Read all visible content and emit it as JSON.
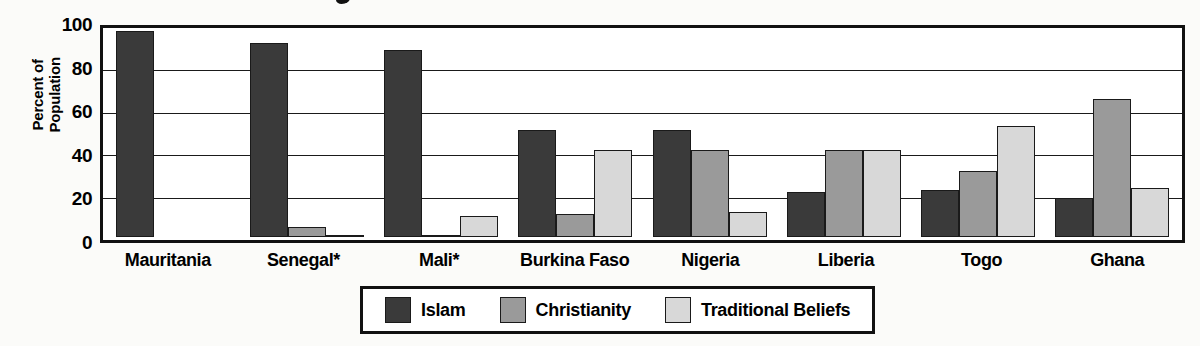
{
  "chart_data": {
    "type": "bar",
    "title": "",
    "xlabel": "",
    "ylabel": "Percent of Population",
    "ylabel_lines": [
      "Percent of",
      "Population"
    ],
    "ylim": [
      0,
      100
    ],
    "yticks": [
      100,
      80,
      60,
      40,
      20,
      0
    ],
    "grid": true,
    "legend_position": "bottom-center",
    "categories": [
      "Mauritania",
      "Senegal*",
      "Mali*",
      "Burkina Faso",
      "Nigeria",
      "Liberia",
      "Togo",
      "Ghana"
    ],
    "series": [
      {
        "name": "Islam",
        "color": "#3a3a3a",
        "values": [
          100,
          94,
          91,
          52,
          52,
          22,
          23,
          19
        ]
      },
      {
        "name": "Christianity",
        "color": "#9a9a9a",
        "values": [
          0,
          5,
          1,
          11,
          42,
          42,
          32,
          67
        ]
      },
      {
        "name": "Traditional Beliefs",
        "color": "#d8d8d8",
        "values": [
          0,
          1,
          10,
          42,
          12,
          42,
          54,
          24
        ]
      }
    ]
  },
  "legend": {
    "items": [
      {
        "label": "Islam",
        "key": "islam"
      },
      {
        "label": "Christianity",
        "key": "christianity"
      },
      {
        "label": "Traditional Beliefs",
        "key": "traditional"
      }
    ]
  },
  "colors": {
    "islam": "#3a3a3a",
    "christianity": "#9a9a9a",
    "traditional": "#d8d8d8",
    "axis": "#111111",
    "background": "#fbfbf9"
  }
}
